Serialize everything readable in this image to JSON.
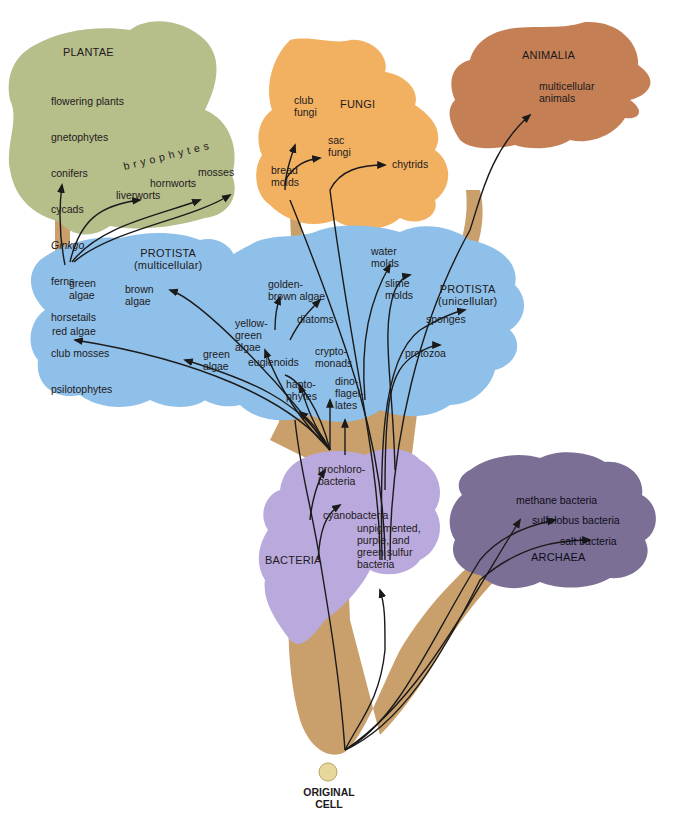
{
  "colors": {
    "plantae": "#b6be8a",
    "fungi": "#f2b160",
    "animalia": "#c47f54",
    "protista": "#8fc0ea",
    "bacteria": "#b9a9dc",
    "archaea": "#7b6f96",
    "trunk": "#c9a06c",
    "arrow": "#1a1a1a",
    "original_cell": "#e8d79a"
  },
  "kingdoms": {
    "plantae": {
      "title": "PLANTAE",
      "list": [
        "flowering plants",
        "gnetophytes",
        "conifers",
        "cycads",
        "Ginkgo",
        "ferns",
        "horsetails",
        "club mosses",
        "psilotophytes"
      ],
      "bryophytes_label": "bryophytes",
      "bryophytes": [
        "liverworts",
        "hornworts",
        "mosses"
      ]
    },
    "fungi": {
      "title": "FUNGI",
      "groups": [
        "club\nfungi",
        "sac\nfungi",
        "bread\nmolds",
        "chytrids"
      ]
    },
    "animalia": {
      "title": "ANIMALIA",
      "groups": [
        "multicellular\nanimals"
      ]
    },
    "protista_multicellular": {
      "title": "PROTISTA\n(multicellular)",
      "groups": [
        "green\nalgae",
        "brown\nalgae",
        "red algae"
      ]
    },
    "protista_unicellular": {
      "title": "PROTISTA\n(unicellular)",
      "groups": [
        "water\nmolds",
        "slime\nmolds",
        "golden-\nbrown algae",
        "diatoms",
        "yellow-\ngreen\nalgae",
        "green\nalgae",
        "euglenoids",
        "crypto-\nmonads",
        "hapto-\nphytes",
        "dino-\nflagel-\nlates",
        "sponges",
        "protozoa"
      ]
    },
    "bacteria": {
      "title": "BACTERIA",
      "groups": [
        "prochloro-\nbacteria",
        "cyanobacteria",
        "unpigmented,\npurple, and\ngreen sulfur\nbacteria"
      ]
    },
    "archaea": {
      "title": "ARCHAEA",
      "groups": [
        "methane bacteria",
        "sulfolobus bacteria",
        "salt bacteria"
      ]
    }
  },
  "root": {
    "label": "ORIGINAL\nCELL"
  }
}
